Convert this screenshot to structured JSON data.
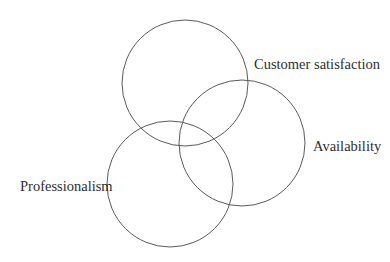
{
  "diagram": {
    "type": "venn",
    "sets": [
      {
        "id": "customer-satisfaction",
        "label": "Customer satisfaction"
      },
      {
        "id": "availability",
        "label": "Availability"
      },
      {
        "id": "professionalism",
        "label": "Professionalism"
      }
    ],
    "stroke_color": "#5a5a5a",
    "text_color": "#2e2e2e",
    "background": "#ffffff"
  }
}
